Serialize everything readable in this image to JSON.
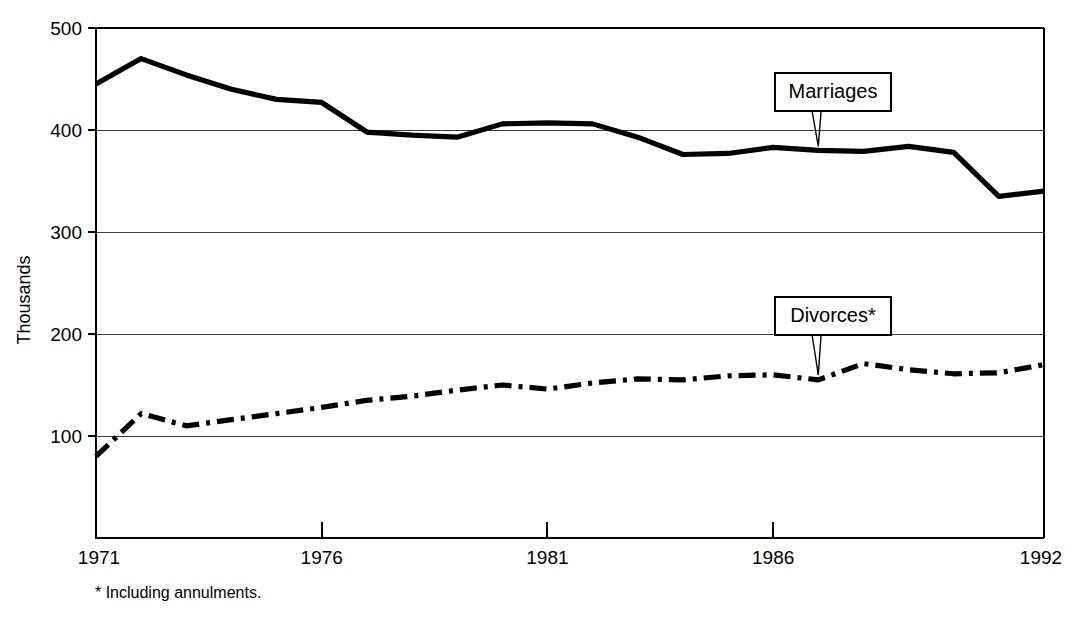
{
  "chart_data": {
    "type": "line",
    "title": "",
    "subtitle": "",
    "xlabel": "",
    "ylabel": "Thousands",
    "x": [
      1971,
      1972,
      1973,
      1974,
      1975,
      1976,
      1977,
      1978,
      1979,
      1980,
      1981,
      1982,
      1983,
      1984,
      1985,
      1986,
      1987,
      1988,
      1989,
      1990,
      1991,
      1992
    ],
    "xlim": [
      1971,
      1992
    ],
    "ylim": [
      0,
      500
    ],
    "y_ticks": [
      100,
      200,
      300,
      400,
      500
    ],
    "x_ticks": [
      1971,
      1976,
      1981,
      1986,
      1992
    ],
    "x_tick_labels": [
      "1971",
      "1976",
      "1981",
      "1986",
      "1992"
    ],
    "y_tick_labels": [
      "100",
      "200",
      "300",
      "400",
      "500"
    ],
    "grid": "horizontal",
    "legend_position": "inline-callouts",
    "series": [
      {
        "name": "Marriages",
        "style": "solid",
        "values": [
          445,
          470,
          454,
          440,
          430,
          427,
          398,
          395,
          393,
          406,
          407,
          406,
          393,
          376,
          377,
          383,
          380,
          379,
          384,
          378,
          335,
          340
        ]
      },
      {
        "name": "Divorces*",
        "style": "dash-dot",
        "values": [
          80,
          122,
          110,
          116,
          122,
          128,
          135,
          139,
          145,
          150,
          146,
          152,
          156,
          155,
          159,
          160,
          155,
          171,
          165,
          161,
          162,
          170
        ]
      }
    ],
    "annotations": [
      {
        "label": "Marriages",
        "points_to_year": 1987,
        "points_to_value": 384
      },
      {
        "label": "Divorces*",
        "points_to_year": 1987,
        "points_to_value": 160
      }
    ],
    "footnote": "* Including annulments.",
    "colors": {
      "line": "#000000",
      "grid": "#3a3a3a",
      "background": "#ffffff"
    }
  },
  "callouts": {
    "marriages_label": "Marriages",
    "divorces_label": "Divorces*"
  },
  "axis": {
    "y_title": "Thousands"
  },
  "footnote": {
    "text": "* Including annulments."
  }
}
